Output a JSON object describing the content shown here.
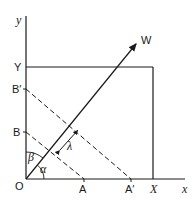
{
  "diagram": {
    "axes": {
      "x_label": "x",
      "y_label": "y"
    },
    "points": {
      "origin": "O",
      "A": "A",
      "A_prime": "A′",
      "B": "B",
      "B_prime": "B′",
      "X": "X",
      "Y": "Y"
    },
    "vector": {
      "label": "W"
    },
    "angles": {
      "alpha": "α",
      "beta": "β"
    },
    "spacing": {
      "label": "λ"
    },
    "colors": {
      "ink": "#1a1a1a",
      "background": "#ffffff"
    }
  }
}
